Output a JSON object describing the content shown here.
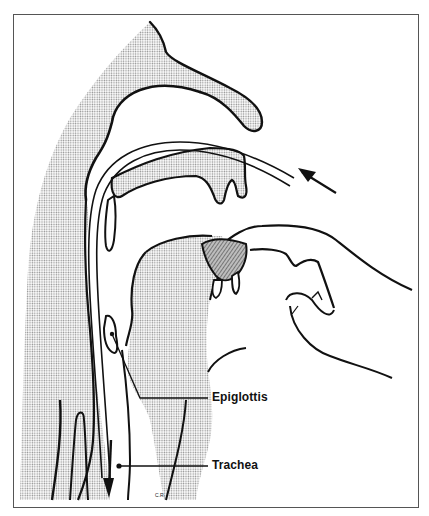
{
  "figure": {
    "labels": {
      "epiglottis": "Epiglottis",
      "trachea": "Trachea"
    },
    "signature": "C.R.",
    "colors": {
      "line": "#111111",
      "stipple": "#9a9a9a",
      "frame": "#555555",
      "background": "#ffffff"
    },
    "annotations": [
      {
        "name": "tube-entry-arrow",
        "direction": "up-left",
        "description": "arrow indicating tube insertion at nose"
      },
      {
        "name": "tube-exit-arrow",
        "direction": "down",
        "description": "arrow indicating tube passing down esophagus"
      }
    ]
  }
}
